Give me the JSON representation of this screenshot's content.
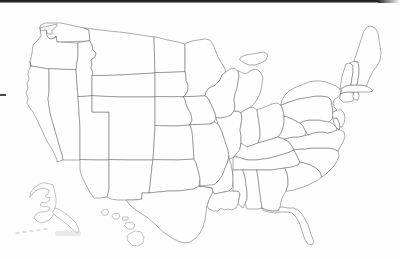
{
  "document": {
    "title": "Blank United States Map",
    "type": "map",
    "description": "Scanned outline map of the United States with state borders, no labels",
    "background_color": "#fdfdfd",
    "border_color": "#6b6b6b",
    "inset_border_color": "#8a8a8a",
    "width": 400,
    "height": 259
  },
  "artifacts": {
    "top_scan_edge_label": "scan-edge-top",
    "left_tick_label": "scan-tick-left",
    "smudge_label": "scan-smudge"
  },
  "map": {
    "projection_note": "contiguous-48-with-alaska-hawaii-insets",
    "region_count": 50,
    "labels_visible": false,
    "insets": [
      {
        "name": "Alaska",
        "position": "lower-left"
      },
      {
        "name": "Hawaii",
        "position": "lower-center-left"
      }
    ],
    "regions": [
      {
        "name": "Washington"
      },
      {
        "name": "Oregon"
      },
      {
        "name": "California"
      },
      {
        "name": "Nevada"
      },
      {
        "name": "Idaho"
      },
      {
        "name": "Montana"
      },
      {
        "name": "Wyoming"
      },
      {
        "name": "Utah"
      },
      {
        "name": "Arizona"
      },
      {
        "name": "New Mexico"
      },
      {
        "name": "Colorado"
      },
      {
        "name": "North Dakota"
      },
      {
        "name": "South Dakota"
      },
      {
        "name": "Nebraska"
      },
      {
        "name": "Kansas"
      },
      {
        "name": "Oklahoma"
      },
      {
        "name": "Texas"
      },
      {
        "name": "Minnesota"
      },
      {
        "name": "Iowa"
      },
      {
        "name": "Missouri"
      },
      {
        "name": "Arkansas"
      },
      {
        "name": "Louisiana"
      },
      {
        "name": "Wisconsin"
      },
      {
        "name": "Illinois"
      },
      {
        "name": "Michigan"
      },
      {
        "name": "Indiana"
      },
      {
        "name": "Ohio"
      },
      {
        "name": "Kentucky"
      },
      {
        "name": "Tennessee"
      },
      {
        "name": "Mississippi"
      },
      {
        "name": "Alabama"
      },
      {
        "name": "Georgia"
      },
      {
        "name": "Florida"
      },
      {
        "name": "South Carolina"
      },
      {
        "name": "North Carolina"
      },
      {
        "name": "Virginia"
      },
      {
        "name": "West Virginia"
      },
      {
        "name": "Maryland"
      },
      {
        "name": "Delaware"
      },
      {
        "name": "Pennsylvania"
      },
      {
        "name": "New Jersey"
      },
      {
        "name": "New York"
      },
      {
        "name": "Connecticut"
      },
      {
        "name": "Rhode Island"
      },
      {
        "name": "Massachusetts"
      },
      {
        "name": "Vermont"
      },
      {
        "name": "New Hampshire"
      },
      {
        "name": "Maine"
      },
      {
        "name": "Alaska"
      },
      {
        "name": "Hawaii"
      }
    ]
  }
}
